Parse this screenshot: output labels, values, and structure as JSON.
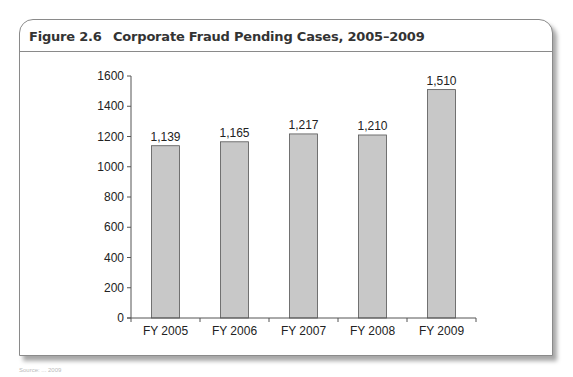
{
  "figure": {
    "number": "Figure 2.6",
    "title": "Corporate Fraud Pending Cases, 2005–2009"
  },
  "chart_data": {
    "type": "bar",
    "title": "Corporate Fraud Pending Cases, 2005–2009",
    "categories": [
      "FY 2005",
      "FY 2006",
      "FY 2007",
      "FY 2008",
      "FY 2009"
    ],
    "values": [
      1139,
      1165,
      1217,
      1210,
      1510
    ],
    "value_labels": [
      "1,139",
      "1,165",
      "1,217",
      "1,210",
      "1,510"
    ],
    "xlabel": "",
    "ylabel": "",
    "ylim": [
      0,
      1600
    ],
    "yticks": [
      0,
      200,
      400,
      600,
      800,
      1000,
      1200,
      1400,
      1600
    ],
    "grid": false,
    "legend": "none",
    "bar_color": "#c8c8c8",
    "bar_edge_color": "#555555"
  },
  "source_note": "Source: ... 2009"
}
